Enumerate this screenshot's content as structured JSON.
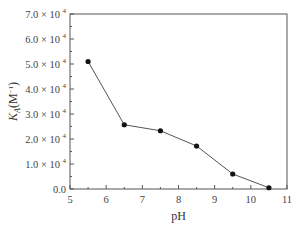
{
  "chart_data": {
    "type": "line",
    "title": "",
    "xlabel": "pH",
    "ylabel": "K_A(M^-1)",
    "ylabel_parts": {
      "main": "K",
      "sub": "A",
      "unit": "(M",
      "exp": "−1",
      "close": ")"
    },
    "x": [
      5.5,
      6.5,
      7.5,
      8.5,
      9.5,
      10.5
    ],
    "series": [
      {
        "name": "K_A",
        "values": [
          51000,
          25700,
          23300,
          17200,
          6000,
          500
        ]
      }
    ],
    "xlim": [
      5,
      11
    ],
    "ylim": [
      0,
      70000
    ],
    "x_ticks": [
      "5",
      "6",
      "7",
      "8",
      "9",
      "10",
      "11"
    ],
    "y_ticks": [
      {
        "mant": "0.0",
        "exp": ""
      },
      {
        "mant": "1.0 × 10",
        "exp": "4"
      },
      {
        "mant": "2.0 × 10",
        "exp": "4"
      },
      {
        "mant": "3.0 × 10",
        "exp": "4"
      },
      {
        "mant": "4.0 × 10",
        "exp": "4"
      },
      {
        "mant": "5.0 × 10",
        "exp": "4"
      },
      {
        "mant": "6.0 × 10",
        "exp": "4"
      },
      {
        "mant": "7.0 × 10",
        "exp": "4"
      }
    ],
    "grid": false,
    "legend": null,
    "colors": {
      "line": "#555555",
      "marker": "#111111",
      "axis": "#555555"
    }
  }
}
